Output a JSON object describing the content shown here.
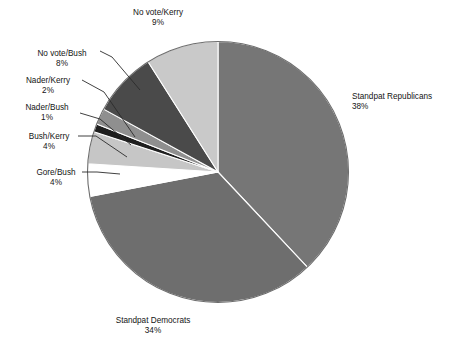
{
  "figure": {
    "background_color": "#ffffff",
    "label_text_color": "#141414",
    "leader_line_color": "#2b2b2b"
  },
  "chart_data": {
    "type": "pie",
    "title": "",
    "subtitle": "",
    "xlabel": "",
    "ylabel": "",
    "legend_position": "none",
    "grid": false,
    "start_angle_deg": 0,
    "direction": "clockwise",
    "total_percent": 100,
    "value_unit": "%",
    "categories": [
      "Standpat Republicans",
      "Standpat Democrats",
      "Gore/Bush",
      "Bush/Kerry",
      "Nader/Bush",
      "Nader/Kerry",
      "No vote/Bush",
      "No vote/Kerry"
    ],
    "values": [
      38,
      34,
      4,
      4,
      1,
      2,
      8,
      9
    ],
    "colors": [
      "#767676",
      "#6e6e6e",
      "#ffffff",
      "#c6c6c6",
      "#1e1e1e",
      "#8f8f8f",
      "#4a4a4a",
      "#c9c9c9"
    ],
    "slices": [
      {
        "name": "Standpat Republicans",
        "value": 38,
        "label": "Standpat Republicans",
        "percent_label": "38%",
        "color": "#767676",
        "label_x": 352,
        "label_y": 99,
        "label_anchor": "start",
        "leader": false
      },
      {
        "name": "Standpat Democrats",
        "value": 34,
        "label": "Standpat Democrats",
        "percent_label": "34%",
        "color": "#6e6e6e",
        "label_x": 153,
        "label_y": 323,
        "label_anchor": "middle",
        "leader": false
      },
      {
        "name": "Gore/Bush",
        "value": 4,
        "label": "Gore/Bush",
        "percent_label": "4%",
        "color": "#ffffff",
        "label_x": 56,
        "label_y": 175,
        "label_anchor": "middle",
        "leader": true,
        "leader_points": "82,172 97,172 120,174"
      },
      {
        "name": "Bush/Kerry",
        "value": 4,
        "label": "Bush/Kerry",
        "percent_label": "4%",
        "color": "#c6c6c6",
        "label_x": 49,
        "label_y": 139,
        "label_anchor": "middle",
        "leader": true,
        "leader_points": "78,136 96,136 127,157"
      },
      {
        "name": "Nader/Bush",
        "value": 1,
        "label": "Nader/Bush",
        "percent_label": "1%",
        "color": "#1e1e1e",
        "label_x": 47,
        "label_y": 110,
        "label_anchor": "middle",
        "leader": true,
        "leader_points": "80,113 100,119 131,145"
      },
      {
        "name": "Nader/Kerry",
        "value": 2,
        "label": "Nader/Kerry",
        "percent_label": "2%",
        "color": "#8f8f8f",
        "label_x": 48,
        "label_y": 83,
        "label_anchor": "middle",
        "leader": true,
        "leader_points": "82,80 104,92 135,137"
      },
      {
        "name": "No vote/Bush",
        "value": 8,
        "label": "No vote/Bush",
        "percent_label": "8%",
        "color": "#4a4a4a",
        "label_x": 62,
        "label_y": 56,
        "label_anchor": "middle",
        "leader": true,
        "leader_points": "100,51 112,57 140,90"
      },
      {
        "name": "No vote/Kerry",
        "value": 9,
        "label": "No vote/Kerry",
        "percent_label": "9%",
        "color": "#c9c9c9",
        "label_x": 158,
        "label_y": 15,
        "label_anchor": "middle",
        "leader": false
      }
    ]
  }
}
